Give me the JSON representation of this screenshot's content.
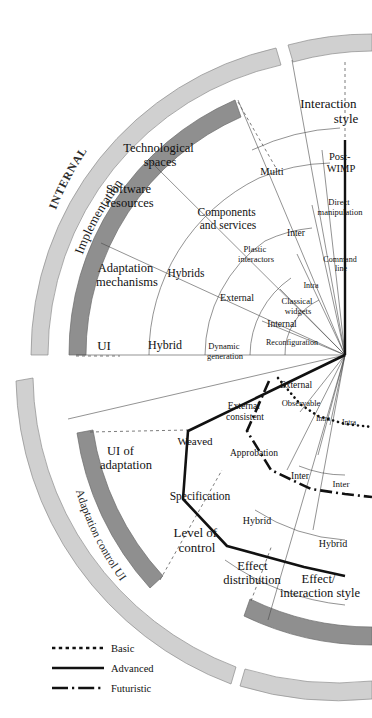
{
  "figure": {
    "type": "radial-taxonomy-fan",
    "center": {
      "x": 345,
      "y": 355
    },
    "background": "#ffffff",
    "ink": "#111111",
    "band_light": "#cfcfcf",
    "band_dark": "#8f8f8f",
    "hairline": "#555555"
  },
  "outer_bands": [
    {
      "name": "INTERNAL",
      "label": "INTERNAL",
      "shade": "light"
    },
    {
      "name": "Adaptation control UI",
      "label": "Adaptation control UI",
      "shade": "light"
    }
  ],
  "inner_bands": [
    {
      "name": "Implementation",
      "label": "Implementation",
      "shade": "dark"
    },
    {
      "name": "UI of adaptation",
      "label": "UI of adaptation",
      "shade": "dark"
    },
    {
      "name": "Effect interaction style",
      "label": "Effect/ interaction style",
      "shade": "dark"
    }
  ],
  "axis_titles": [
    {
      "id": "implementation",
      "label": "Implementation"
    },
    {
      "id": "interaction-style",
      "label": "Interaction style",
      "lines": [
        "Interaction",
        "style"
      ]
    },
    {
      "id": "ui-of-adaptation",
      "label": "UI of adaptation",
      "lines": [
        "UI of",
        "adaptation"
      ]
    },
    {
      "id": "level-of-control",
      "label": "Level of control",
      "lines": [
        "Level of",
        "control"
      ]
    },
    {
      "id": "effect-distribution",
      "label": "Effect distribution",
      "lines": [
        "Effect",
        "distribution"
      ]
    },
    {
      "id": "effect-interaction-style",
      "label": "Effect/ interaction style",
      "lines": [
        "Effect/",
        "interaction style"
      ]
    },
    {
      "id": "technological-spaces",
      "label": "Technological spaces",
      "lines": [
        "Technological",
        "spaces"
      ]
    },
    {
      "id": "software-resources",
      "label": "Software resources",
      "lines": [
        "Software",
        "resources"
      ]
    },
    {
      "id": "adaptation-mechanisms",
      "label": "Adaptation mechanisms",
      "lines": [
        "Adaptation",
        "mechanisms"
      ]
    }
  ],
  "sector_labels": [
    {
      "id": "technological-spaces",
      "lines": [
        "Technological",
        "spaces"
      ],
      "x": 160,
      "y": 152,
      "size": 12.5,
      "anchor": "middle",
      "rotate": 0
    },
    {
      "id": "software-resources",
      "lines": [
        "Software",
        "resources"
      ],
      "x": 130,
      "y": 193,
      "size": 12.5,
      "anchor": "middle",
      "rotate": 0
    },
    {
      "id": "adaptation-mechanisms",
      "lines": [
        "Adaptation",
        "mechanisms"
      ],
      "x": 127,
      "y": 272,
      "size": 12.5,
      "anchor": "middle",
      "rotate": 0
    },
    {
      "id": "components-and-services",
      "lines": [
        "Components",
        "and services"
      ],
      "x": 228,
      "y": 216,
      "size": 11.5,
      "anchor": "middle",
      "rotate": 0
    },
    {
      "id": "plastic-interactors",
      "lines": [
        "Plastic",
        "interactors"
      ],
      "x": 256,
      "y": 252,
      "size": 8.5,
      "anchor": "middle",
      "rotate": 0
    },
    {
      "id": "multi",
      "lines": [
        "Multi"
      ],
      "x": 272,
      "y": 175,
      "size": 10.5,
      "anchor": "middle",
      "rotate": 0
    },
    {
      "id": "inter-style",
      "lines": [
        "Inter"
      ],
      "x": 296,
      "y": 236,
      "size": 9.5,
      "anchor": "middle",
      "rotate": 0
    },
    {
      "id": "intra-style",
      "lines": [
        "Intra"
      ],
      "x": 311,
      "y": 288,
      "size": 8,
      "anchor": "middle",
      "rotate": 0
    },
    {
      "id": "post-wimp",
      "lines": [
        "Post-",
        "WIMP"
      ],
      "x": 341,
      "y": 160,
      "size": 10.5,
      "anchor": "middle",
      "rotate": 0
    },
    {
      "id": "direct-manipulation",
      "lines": [
        "Direct",
        "manipulation"
      ],
      "x": 340,
      "y": 205,
      "size": 8.5,
      "anchor": "middle",
      "rotate": 0
    },
    {
      "id": "command-line",
      "lines": [
        "Command",
        "line"
      ],
      "x": 339,
      "y": 262,
      "size": 8,
      "anchor": "middle",
      "rotate": 0
    },
    {
      "id": "classical-widgets",
      "lines": [
        "Classical",
        "widgets"
      ],
      "x": 298,
      "y": 304,
      "size": 8.5,
      "anchor": "middle",
      "rotate": 0
    },
    {
      "id": "hybrids",
      "lines": [
        "Hybrids"
      ],
      "x": 186,
      "y": 277,
      "size": 11.5,
      "anchor": "middle",
      "rotate": 0
    },
    {
      "id": "external-impl",
      "lines": [
        "External"
      ],
      "x": 237,
      "y": 301,
      "size": 10,
      "anchor": "middle",
      "rotate": 0
    },
    {
      "id": "internal-impl",
      "lines": [
        "Internal"
      ],
      "x": 282,
      "y": 327,
      "size": 9.5,
      "anchor": "middle",
      "rotate": 0
    },
    {
      "id": "ui",
      "lines": [
        "UI"
      ],
      "x": 104,
      "y": 348,
      "size": 13,
      "anchor": "middle",
      "rotate": 0
    },
    {
      "id": "hybrid-impl",
      "lines": [
        "Hybrid"
      ],
      "x": 165,
      "y": 347,
      "size": 12,
      "anchor": "middle",
      "rotate": 0
    },
    {
      "id": "dynamic-generation",
      "lines": [
        "Dynamic",
        "generation"
      ],
      "x": 225,
      "y": 349,
      "size": 8.5,
      "anchor": "middle",
      "rotate": 0
    },
    {
      "id": "reconfiguration",
      "lines": [
        "Reconfiguration"
      ],
      "x": 292,
      "y": 345,
      "size": 8,
      "anchor": "middle",
      "rotate": 0
    },
    {
      "id": "external-obs",
      "lines": [
        "External"
      ],
      "x": 294,
      "y": 387,
      "size": 9.5,
      "anchor": "middle",
      "rotate": 0
    },
    {
      "id": "observable",
      "lines": [
        "Observable"
      ],
      "x": 300,
      "y": 406,
      "size": 8.5,
      "anchor": "middle",
      "rotate": 0
    },
    {
      "id": "intra-obs-1",
      "lines": [
        "Intra"
      ],
      "x": 322,
      "y": 420,
      "size": 7.5,
      "anchor": "middle",
      "rotate": 0
    },
    {
      "id": "intra-obs-2",
      "lines": [
        "Intra"
      ],
      "x": 346,
      "y": 424,
      "size": 7.5,
      "anchor": "middle",
      "rotate": 0
    },
    {
      "id": "external-consistent",
      "lines": [
        "External",
        "consistent"
      ],
      "x": 245,
      "y": 409,
      "size": 9.5,
      "anchor": "middle",
      "rotate": 0
    },
    {
      "id": "weaved",
      "lines": [
        "Weaved"
      ],
      "x": 195,
      "y": 443,
      "size": 11,
      "anchor": "middle",
      "rotate": 0
    },
    {
      "id": "approbation",
      "lines": [
        "Approbation"
      ],
      "x": 254,
      "y": 455,
      "size": 9.5,
      "anchor": "middle",
      "rotate": 0
    },
    {
      "id": "inter-effect-1",
      "lines": [
        "Inter"
      ],
      "x": 300,
      "y": 478,
      "size": 9.5,
      "anchor": "middle",
      "rotate": 0
    },
    {
      "id": "inter-effect-2",
      "lines": [
        "Inter"
      ],
      "x": 340,
      "y": 487,
      "size": 9,
      "anchor": "middle",
      "rotate": 0
    },
    {
      "id": "specification",
      "lines": [
        "Specification"
      ],
      "x": 200,
      "y": 498,
      "size": 11.5,
      "anchor": "middle",
      "rotate": 0
    },
    {
      "id": "hybrid-effect-1",
      "lines": [
        "Hybrid"
      ],
      "x": 257,
      "y": 523,
      "size": 10,
      "anchor": "middle",
      "rotate": 0
    },
    {
      "id": "hybrid-effect-2",
      "lines": [
        "Hybrid"
      ],
      "x": 332,
      "y": 546,
      "size": 10,
      "anchor": "middle",
      "rotate": 0
    }
  ],
  "band_labels": [
    {
      "id": "internal",
      "label": "INTERNAL",
      "size": 11.5,
      "letter_spacing": 0.8,
      "style": "curved-band-light"
    },
    {
      "id": "implementation",
      "label": "Implementation",
      "size": 13,
      "style": "curved-inner"
    },
    {
      "id": "adaptation-control-ui",
      "label": "Adaptation control UI",
      "size": 11.5,
      "style": "curved-band-light"
    }
  ],
  "callout_labels": [
    {
      "id": "interaction-style",
      "lines": [
        "Interaction",
        "style"
      ],
      "x": 330,
      "y": 108,
      "size": 13,
      "anchor": "middle"
    },
    {
      "id": "ui-of-adaptation",
      "lines": [
        "UI of",
        "adaptation"
      ],
      "x": 120,
      "y": 455,
      "size": 12.5,
      "anchor": "middle"
    },
    {
      "id": "level-of-control",
      "lines": [
        "Level of",
        "control"
      ],
      "x": 197,
      "y": 537,
      "size": 13,
      "anchor": "middle"
    },
    {
      "id": "effect-distribution",
      "lines": [
        "Effect",
        "distribution"
      ],
      "x": 254,
      "y": 570,
      "size": 12.5,
      "anchor": "middle"
    },
    {
      "id": "effect-interaction-style",
      "lines": [
        "Effect/",
        "interaction style"
      ],
      "x": 318,
      "y": 583,
      "size": 12.5,
      "anchor": "middle"
    }
  ],
  "legend": {
    "x": 55,
    "y": 648,
    "items": [
      {
        "id": "basic",
        "label": "Basic",
        "style": "dotted"
      },
      {
        "id": "advanced",
        "label": "Advanced",
        "style": "solid"
      },
      {
        "id": "futuristic",
        "label": "Futuristic",
        "style": "dashdot"
      }
    ]
  }
}
